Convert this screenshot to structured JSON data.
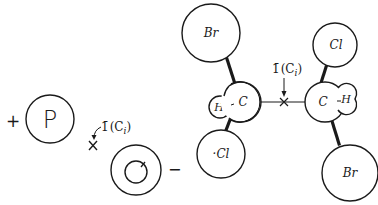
{
  "diagram": {
    "left_group": {
      "plus_sign": "+",
      "p_circle_label": "P",
      "symmetry_label_bar": "1̄",
      "symmetry_label_paren": "(C",
      "symmetry_label_sub": "i",
      "symmetry_label_close": ")",
      "minus_sign": "−"
    },
    "molecule": {
      "left_br": "Br",
      "left_c": "C",
      "left_h": "H",
      "left_cl": "·Cl",
      "right_cl": "Cl",
      "right_c": "C",
      "right_h": "H",
      "right_br": "Br",
      "symmetry_label_bar": "1̄",
      "symmetry_label_paren": "(C",
      "symmetry_label_sub": "i",
      "symmetry_label_close": ")"
    },
    "colors": {
      "ink": "#1a1a1a",
      "background": "#ffffff"
    }
  }
}
